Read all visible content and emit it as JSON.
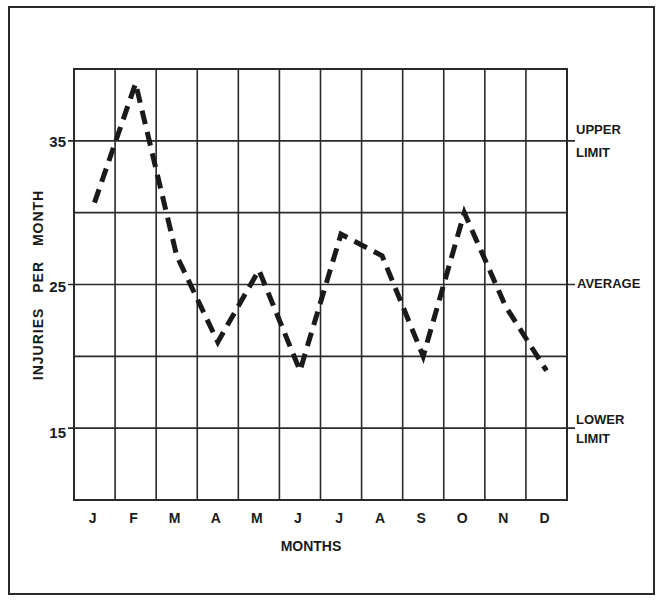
{
  "chart_data": {
    "type": "line",
    "title": "",
    "xlabel": "MONTHS",
    "ylabel": "INJURIES PER MONTH",
    "categories": [
      "J",
      "F",
      "M",
      "A",
      "M",
      "J",
      "J",
      "A",
      "S",
      "O",
      "N",
      "D"
    ],
    "series": [
      {
        "name": "Injuries per month",
        "style": "dashed",
        "values": [
          30.7,
          39,
          27,
          21,
          26,
          19,
          28.5,
          27,
          20,
          30,
          23.5,
          19
        ]
      }
    ],
    "ylim": [
      10,
      40
    ],
    "yticks": [
      15,
      25,
      35
    ],
    "ytick_labels": [
      "15",
      "25",
      "35"
    ],
    "grid": true,
    "horizontal_gridlines": [
      15,
      20,
      25,
      30,
      35
    ],
    "reference_lines": [
      {
        "label": "UPPER LIMIT",
        "value": 35
      },
      {
        "label": "AVERAGE",
        "value": 25
      },
      {
        "label": "LOWER LIMIT",
        "value": 15
      }
    ],
    "legend": null
  },
  "labels": {
    "xlabel": "MONTHS",
    "ylabel": "INJURIES PER MONTH",
    "upper_limit_1": "UPPER",
    "upper_limit_2": "LIMIT",
    "average": "AVERAGE",
    "lower_limit_1": "LOWER",
    "lower_limit_2": "LIMIT",
    "ytick_35": "35",
    "ytick_25": "25",
    "ytick_15": "15"
  },
  "colors": {
    "line": "#1a1a1a",
    "grid": "#2a2a2a",
    "background": "#ffffff"
  }
}
